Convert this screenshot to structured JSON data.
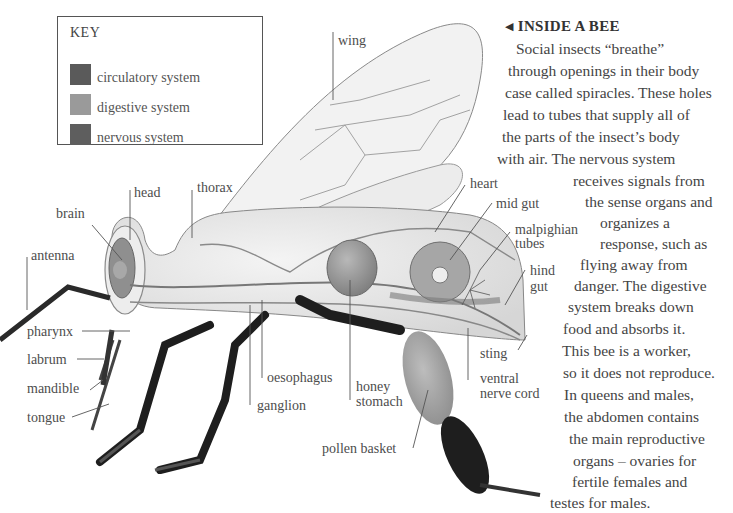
{
  "key": {
    "title": "KEY",
    "items": [
      {
        "label": "circulatory system",
        "color": "#5a5a5a"
      },
      {
        "label": "digestive system",
        "color": "#9a9a9a"
      },
      {
        "label": "nervous system",
        "color": "#5e5e5e"
      }
    ]
  },
  "diagram": {
    "labels": {
      "wing": "wing",
      "head": "head",
      "thorax": "thorax",
      "brain": "brain",
      "antenna": "antenna",
      "pharynx": "pharynx",
      "labrum": "labrum",
      "mandible": "mandible",
      "tongue": "tongue",
      "ganglion": "ganglion",
      "oesophagus": "oesophagus",
      "honey_stomach_1": "honey",
      "honey_stomach_2": "stomach",
      "pollen_basket": "pollen basket",
      "heart": "heart",
      "mid_gut": "mid gut",
      "malpighian_1": "malpighian",
      "malpighian_2": "tubes",
      "hind_gut_1": "hind",
      "hind_gut_2": "gut",
      "sting": "sting",
      "ventral_1": "ventral",
      "ventral_2": "nerve cord"
    }
  },
  "article": {
    "title_arrow": "◀",
    "title": "INSIDE A BEE",
    "lines": [
      "Social insects “breathe”",
      "through openings in their body",
      "case called spiracles. These holes",
      "lead to tubes that supply all of",
      "the parts of the insect’s body",
      "with air. The nervous system",
      "receives signals from",
      "the sense organs and",
      "organizes a",
      "response, such as",
      "flying away from",
      "danger. The digestive",
      "system breaks down",
      "food and absorbs it.",
      "This bee is a worker,",
      "so it does not reproduce.",
      "In queens and males,",
      "the abdomen contains",
      "the main reproductive",
      "organs – ovaries for",
      "fertile females and",
      "testes for males."
    ]
  }
}
